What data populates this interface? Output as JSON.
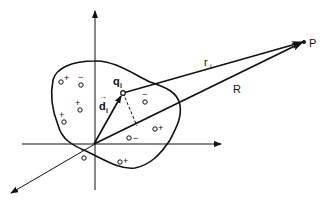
{
  "diagram": {
    "colors": {
      "ink": "#111111",
      "background": "#ffffff"
    },
    "labels": {
      "point": "P",
      "charge": "q",
      "charge_sub": "i",
      "position_vec": "d",
      "position_sub": "i",
      "distance_vec": "r",
      "distance_sub": "i",
      "origin_vec": "R"
    },
    "charges": [
      {
        "sign": "+",
        "x": 61,
        "y": 79
      },
      {
        "sign": "−",
        "x": 81,
        "y": 84
      },
      {
        "sign": "+",
        "x": 78,
        "y": 106
      },
      {
        "sign": "+",
        "x": 63,
        "y": 117
      },
      {
        "sign": "−",
        "x": 146,
        "y": 102
      },
      {
        "sign": "+",
        "x": 155,
        "y": 128
      },
      {
        "sign": "−",
        "x": 130,
        "y": 138
      },
      {
        "sign": "−",
        "x": 84,
        "y": 155
      },
      {
        "sign": "+",
        "x": 122,
        "y": 160
      }
    ]
  }
}
